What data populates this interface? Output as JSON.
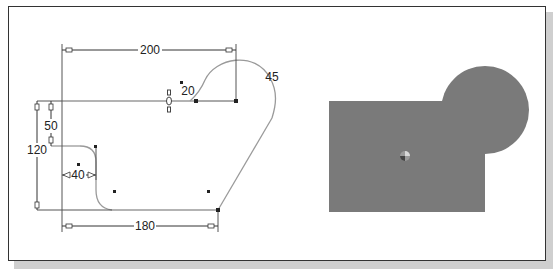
{
  "figure": {
    "sketch_panel": {
      "dimensions": {
        "overall_width": "200",
        "bottom_length": "180",
        "arc_small_radius": "20",
        "arc_large_radius": "45",
        "left_height": "120",
        "step_height": "50",
        "step_width": "40"
      }
    },
    "shaded_panel": {
      "fill_color": "#7a7a7a",
      "description": "shaded region: rectangle with overlapping circle"
    },
    "colors": {
      "frame": "#333333",
      "shadow": "#cfcfcf",
      "sketch_line": "#9a9a9a",
      "dimension_line": "#333333"
    }
  }
}
